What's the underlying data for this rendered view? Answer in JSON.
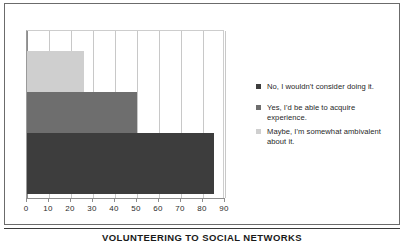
{
  "chart_data": {
    "type": "bar",
    "orientation": "horizontal",
    "title": "",
    "caption": "VOLUNTEERING TO SOCIAL NETWORKS",
    "xlabel": "",
    "ylabel": "",
    "xlim": [
      0,
      90
    ],
    "xticks": [
      0,
      10,
      20,
      30,
      40,
      50,
      60,
      70,
      80,
      90
    ],
    "xtick_labels": [
      "0",
      "10",
      "20",
      "30",
      "40",
      "50",
      "60",
      "70",
      "80",
      "90"
    ],
    "grid": true,
    "legend_position": "right",
    "categories": [
      "Maybe, I'm somewhat ambivalent about it.",
      "Yes, I'd be able to acquire experience.",
      "No, I wouldn't consider doing it."
    ],
    "values": [
      26,
      50,
      85
    ],
    "bars": [
      {
        "label": "Maybe, I'm somewhat ambivalent about it.",
        "value": 26,
        "color": "#cfcfcf"
      },
      {
        "label": "Yes, I'd be able to acquire experience.",
        "value": 50,
        "color": "#6e6e6e"
      },
      {
        "label": "No, I wouldn't consider doing it.",
        "value": 85,
        "color": "#3d3d3d"
      }
    ],
    "legend": [
      {
        "label": "No, I wouldn't consider doing it.",
        "color": "#3d3d3d",
        "swatch": "sw-dark"
      },
      {
        "label": "Yes, I'd be able to acquire experience.",
        "color": "#6e6e6e",
        "swatch": "sw-medium"
      },
      {
        "label": "Maybe, I'm somewhat ambivalent about it.",
        "color": "#cfcfcf",
        "swatch": "sw-light"
      }
    ]
  },
  "legend": {
    "item0": "No, I wouldn't consider doing it.",
    "item1": "Yes, I'd be able to acquire experience.",
    "item2": "Maybe, I'm somewhat ambivalent about it."
  },
  "axis": {
    "t0": "0",
    "t1": "10",
    "t2": "20",
    "t3": "30",
    "t4": "40",
    "t5": "50",
    "t6": "60",
    "t7": "70",
    "t8": "80",
    "t9": "90"
  },
  "caption": {
    "text": "VOLUNTEERING TO SOCIAL NETWORKS"
  },
  "colors": {
    "bar_dark": "#3d3d3d",
    "bar_medium": "#6e6e6e",
    "bar_light": "#cfcfcf",
    "grid": "#c8c8c8",
    "axis": "#8d8d8d",
    "frame": "#6b6b6b"
  }
}
